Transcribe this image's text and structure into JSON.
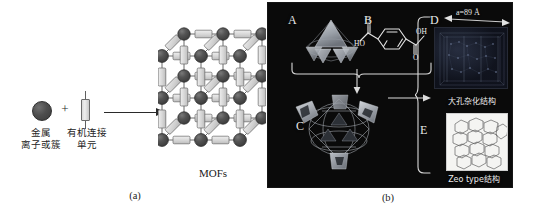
{
  "figure": {
    "panel_a": {
      "caption": "(a)",
      "legend": {
        "metal_node_label": "金属\n离子或簇",
        "metal_node_line1": "金属",
        "metal_node_line2": "离子或簇",
        "plus": "+",
        "linker_line1": "有机连接",
        "linker_line2": "单元"
      },
      "product_label": "MOFs",
      "colors": {
        "metal_node": "#4e4e4e",
        "linker_fill": "#dcdcdc",
        "linker_stroke": "#6b6b6b",
        "bond": "#555555"
      },
      "lattice": {
        "description": "3D cubic MOF framework: dark gray metal node spheres joined by light gray rectangular organic linkers",
        "node_rows": 5,
        "node_cols": 4
      }
    },
    "panel_b": {
      "caption": "(b)",
      "background": "#0a0a0a",
      "letters": {
        "a": "A",
        "b": "B",
        "c": "C",
        "d": "D",
        "e": "E"
      },
      "ligand": {
        "name": "terephthalic-acid",
        "atom_labels": [
          "O",
          "OH",
          "HO",
          "O"
        ]
      },
      "dimension_annotation": {
        "symbol": "a",
        "equals": "=",
        "value": "89",
        "unit": "Å",
        "full": "a=89 Å"
      },
      "sub_captions": {
        "d": "大孔杂化结构",
        "e": "Zeo type结构"
      }
    }
  }
}
